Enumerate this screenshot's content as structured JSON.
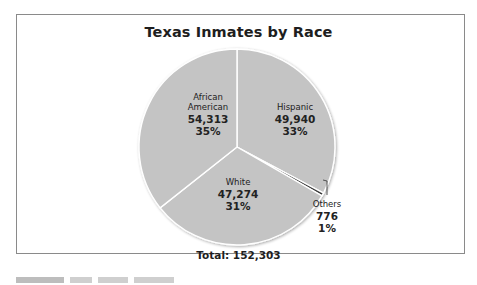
{
  "chart_data": {
    "type": "pie",
    "title": "Texas Inmates by Race",
    "categories": [
      "Hispanic",
      "Others",
      "White",
      "African American"
    ],
    "values": [
      49940,
      776,
      47274,
      54313
    ],
    "percentages": [
      "33%",
      "1%",
      "31%",
      "35%"
    ],
    "total_label": "Total: 152,303",
    "total": 152303,
    "slice_colors": [
      "#c4c4c4",
      "#3a3a3a",
      "#c4c4c4",
      "#c4c4c4"
    ],
    "legend": "none (direct labels)"
  },
  "labels": {
    "african_american": {
      "name_line1": "African",
      "name_line2": "American",
      "value": "54,313",
      "pct": "35%"
    },
    "hispanic": {
      "name": "Hispanic",
      "value": "49,940",
      "pct": "33%"
    },
    "white": {
      "name": "White",
      "value": "47,274",
      "pct": "31%"
    },
    "others": {
      "name": "Others",
      "value": "776",
      "pct": "1%"
    }
  },
  "title": "Texas Inmates by Race",
  "total": "Total: 152,303"
}
